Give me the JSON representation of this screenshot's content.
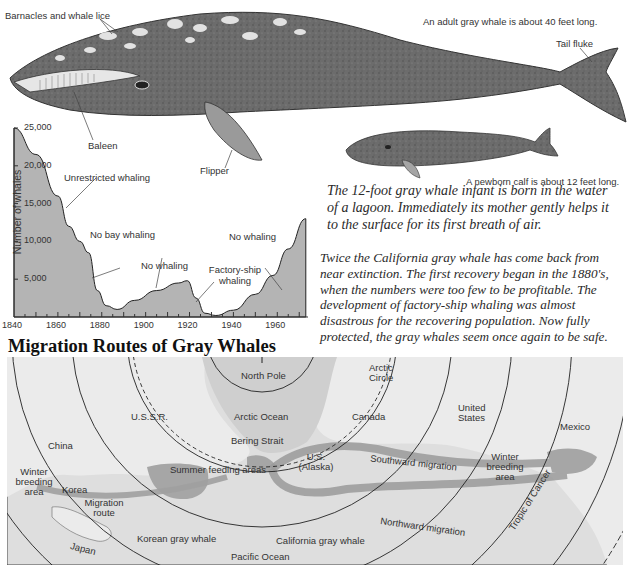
{
  "illustration": {
    "labels": {
      "barnacles": "Barnacles and whale lice",
      "adult_size": "An adult gray whale is about 40 feet long.",
      "tail_fluke": "Tail fluke",
      "baleen": "Baleen",
      "flipper": "Flipper",
      "calf_size": "A newborn calf is about 12 feet long."
    },
    "colors": {
      "whale_body": "#6e6e6e",
      "whale_dark": "#4a4a4a",
      "whale_light": "#cfcfcf"
    }
  },
  "captions": {
    "infant": "The 12-foot gray whale infant is born in the water of a lagoon. Immediately its mother gently helps it to the surface for its first breath of air.",
    "recovery": "Twice the California gray whale has come back from near extinction. The first recovery began in the 1880's, when the numbers were too few to be profitable. The development of factory-ship whaling was almost disastrous for the recovering population. Now fully protected, the gray whales seem once again to be safe."
  },
  "chart_data": {
    "type": "area",
    "title": "",
    "xlabel": "",
    "ylabel": "Number of whales",
    "xlim": [
      1840,
      1974
    ],
    "ylim": [
      0,
      25000
    ],
    "x_ticks": [
      "1840",
      "1860",
      "1880",
      "1900",
      "1920",
      "1940",
      "1960"
    ],
    "y_ticks": [
      "25,000",
      "20,000",
      "15,000",
      "10,000",
      "5,000"
    ],
    "grid": false,
    "legend": null,
    "fill_color": "#b4b4b4",
    "x": [
      1840,
      1850,
      1860,
      1865,
      1870,
      1874,
      1878,
      1882,
      1887,
      1895,
      1905,
      1915,
      1919,
      1923,
      1927,
      1932,
      1940,
      1950,
      1958,
      1965,
      1973
    ],
    "values": [
      25000,
      21500,
      16000,
      12000,
      10000,
      8500,
      3500,
      1500,
      1000,
      2200,
      3500,
      4500,
      4800,
      2500,
      500,
      200,
      900,
      3000,
      5500,
      9000,
      13000
    ],
    "annotations": [
      {
        "text": "Unrestricted whaling",
        "x": 1862,
        "y": 15000
      },
      {
        "text": "No bay whaling",
        "x": 1873,
        "y": 9000
      },
      {
        "text": "No whaling",
        "x": 1906,
        "y": 3500
      },
      {
        "text": "Factory-ship whaling",
        "x": 1924,
        "y": 2200
      },
      {
        "text": "No whaling",
        "x": 1963,
        "y": 7500
      }
    ]
  },
  "map": {
    "title": "Migration Routes of Gray Whales",
    "colors": {
      "sea": "#dcdcdc",
      "land": "#e9e9e9",
      "route": "#9a9a9a",
      "feeding": "#a8a8a8",
      "border": "#555555"
    },
    "labels": {
      "north_pole": "North Pole",
      "arctic_ocean": "Arctic Ocean",
      "arctic_circle": "Arctic Circle",
      "ussr": "U.S.S.R.",
      "canada": "Canada",
      "united_states": "United States",
      "mexico": "Mexico",
      "china": "China",
      "bering_strait": "Bering Strait",
      "alaska": "U.S. (Alaska)",
      "winter_breeding_west": "Winter breeding area",
      "korea": "Korea",
      "migration_route": "Migration route",
      "summer_feeding": "Summer feeding areas",
      "southward": "Southward migration",
      "winter_breeding_east": "Winter breeding area",
      "korean_gray_whale": "Korean gray whale",
      "california_gray_whale": "California gray whale",
      "northward": "Northward migration",
      "tropic_of_cancer": "Tropic of Cancer",
      "japan": "Japan",
      "pacific_ocean": "Pacific Ocean"
    }
  }
}
